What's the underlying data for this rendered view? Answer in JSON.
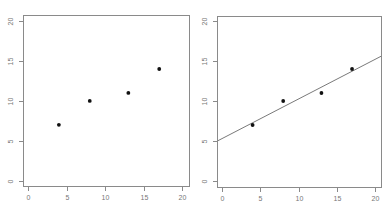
{
  "chart_data": [
    {
      "type": "scatter",
      "title": "",
      "xlabel": "",
      "ylabel": "",
      "xlim": [
        -0.7,
        20.8
      ],
      "ylim": [
        -0.7,
        20.7
      ],
      "grid": false,
      "legend": null,
      "x_ticks": [
        0,
        5,
        10,
        15,
        20
      ],
      "y_ticks": [
        0,
        5,
        10,
        15,
        20
      ],
      "x_tick_labels": [
        "0",
        "5",
        "10",
        "15",
        "20"
      ],
      "y_tick_labels": [
        "0",
        "5",
        "10",
        "15",
        "20"
      ],
      "series": [
        {
          "name": "points",
          "x": [
            4,
            8,
            13,
            17
          ],
          "y": [
            7,
            10,
            11,
            14
          ]
        }
      ]
    },
    {
      "type": "scatter",
      "title": "",
      "xlabel": "",
      "ylabel": "",
      "xlim": [
        -0.7,
        20.8
      ],
      "ylim": [
        -0.7,
        20.7
      ],
      "grid": false,
      "legend": null,
      "x_ticks": [
        0,
        5,
        10,
        15,
        20
      ],
      "y_ticks": [
        0,
        5,
        10,
        15,
        20
      ],
      "x_tick_labels": [
        "0",
        "5",
        "10",
        "15",
        "20"
      ],
      "y_tick_labels": [
        "0",
        "5",
        "10",
        "15",
        "20"
      ],
      "series": [
        {
          "name": "points",
          "x": [
            4,
            8,
            13,
            17
          ],
          "y": [
            7,
            10,
            11,
            14
          ]
        }
      ],
      "fit_line": {
        "type": "linear",
        "intercept": 5.3,
        "slope": 0.495
      }
    }
  ],
  "colors": {
    "axis": "#8a8a8a",
    "tick_label": "#777777",
    "point": "#111111",
    "fit_line": "#6a6a6a"
  },
  "panels": [
    {
      "box": [
        23,
        15,
        189,
        186
      ],
      "x0": 28,
      "xs": 7.72,
      "y0": 180.7,
      "ys": 7.98
    },
    {
      "box": [
        217,
        16,
        381,
        187
      ],
      "x0": 222,
      "xs": 7.65,
      "y0": 181.0,
      "ys": 8.0
    }
  ]
}
